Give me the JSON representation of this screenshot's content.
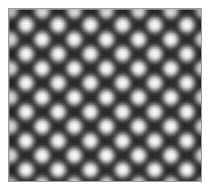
{
  "figure": {
    "kind": "grayscale-raster-image",
    "canvas": {
      "width_px": 211,
      "height_px": 192,
      "background_color": "#ffffff"
    },
    "plate": {
      "left_px": 8,
      "top_px": 8,
      "width_px": 194,
      "height_px": 174,
      "border_color": "#9a9a9a",
      "border_width_px": 1
    },
    "pattern": {
      "type": "2d-sinusoidal-checkerboard",
      "horizontal_period_px": 32.2,
      "vertical_period_px": 29.0,
      "bright_columns": 6,
      "bright_rows": 6,
      "first_bright_center_x_px": 25,
      "first_bright_center_y_px": 24,
      "min_luminance_hex": "#060606",
      "max_luminance_hex": "#fdfdfd",
      "saddle_luminance_hex": "#4a4a4a",
      "orientation_deg": 0,
      "colorspace": "grayscale"
    }
  },
  "chart_data": {
    "type": "heatmap",
    "title": "",
    "xlabel": "",
    "ylabel": "",
    "grid": false,
    "legend": null,
    "colormap": "gray",
    "zlim": [
      0,
      1
    ],
    "x_period_px": 32.2,
    "y_period_px": 29.0,
    "columns": 6,
    "rows": 6,
    "lattice_peaks_x_px": [
      25,
      57,
      89,
      121,
      154,
      186
    ],
    "lattice_peaks_y_px": [
      24,
      53,
      82,
      111,
      140,
      169
    ],
    "peak_values": [
      [
        1.0,
        0.99,
        1.0,
        0.99,
        1.0,
        0.98
      ],
      [
        0.99,
        1.0,
        0.99,
        1.0,
        0.99,
        0.98
      ],
      [
        1.0,
        0.99,
        1.0,
        0.99,
        1.0,
        0.99
      ],
      [
        0.99,
        1.0,
        0.99,
        1.0,
        0.99,
        0.98
      ],
      [
        1.0,
        0.99,
        1.0,
        0.99,
        1.0,
        0.99
      ],
      [
        0.98,
        0.99,
        0.98,
        0.99,
        0.98,
        0.97
      ]
    ],
    "node_value": 0.02,
    "saddle_value": 0.29
  }
}
